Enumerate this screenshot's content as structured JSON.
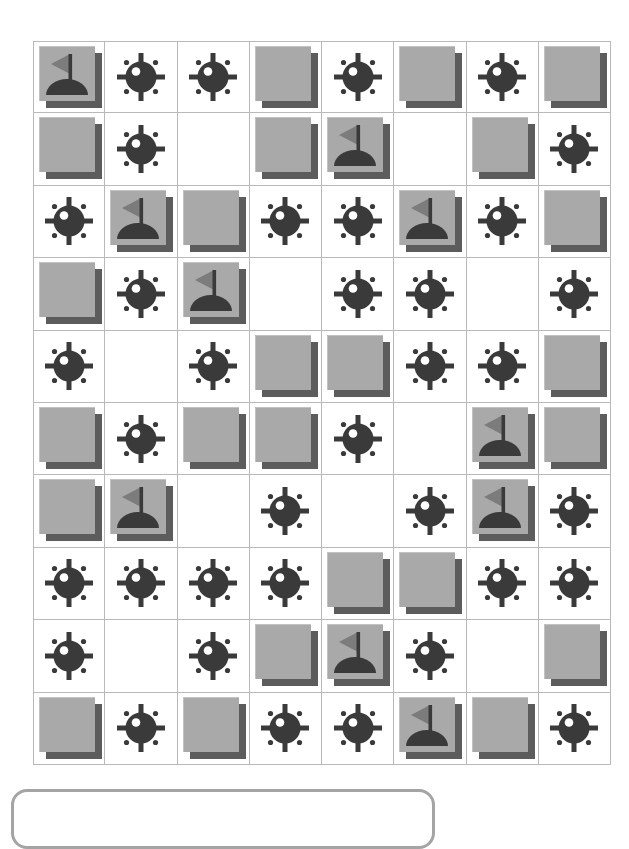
{
  "app": {
    "title": "Minesweeper",
    "board_label": "Minesweeper board",
    "status_panel_label": ""
  },
  "colors": {
    "covered_tile": "#a9a9a9",
    "tile_shadow": "#5c5c5c",
    "tile_highlight": "#c2c2c2",
    "revealed_cell": "#ffffff",
    "mine_dark": "#3a3a3a",
    "flag_dark": "#3a3a3a",
    "grid_line": "#b9b9b9",
    "panel_border": "#a4a4a4",
    "background": "#ffffff"
  },
  "board": {
    "rows": 10,
    "columns": 8,
    "cell_width": 72,
    "cell_height": 72,
    "legend": {
      "covered": "covered-tile",
      "empty": "revealed-empty-cell",
      "mine": "mine-icon",
      "flag": "flag-icon"
    },
    "counts": {
      "mines": 43,
      "flags": 9,
      "covered": 24,
      "empty": 14
    },
    "cells": [
      [
        "flag",
        "mine",
        "mine",
        "covered",
        "mine",
        "covered",
        "mine",
        "covered"
      ],
      [
        "covered",
        "mine",
        "empty",
        "covered",
        "flag",
        "empty",
        "covered",
        "mine"
      ],
      [
        "mine",
        "flag",
        "covered",
        "mine",
        "mine",
        "flag",
        "mine",
        "covered"
      ],
      [
        "covered",
        "mine",
        "flag",
        "empty",
        "mine",
        "mine",
        "empty",
        "mine"
      ],
      [
        "mine",
        "empty",
        "mine",
        "covered",
        "covered",
        "mine",
        "mine",
        "covered"
      ],
      [
        "covered",
        "mine",
        "covered",
        "covered",
        "mine",
        "empty",
        "flag",
        "covered"
      ],
      [
        "covered",
        "flag",
        "empty",
        "mine",
        "empty",
        "mine",
        "flag",
        "mine"
      ],
      [
        "mine",
        "mine",
        "mine",
        "mine",
        "covered",
        "covered",
        "mine",
        "mine"
      ],
      [
        "mine",
        "empty",
        "mine",
        "covered",
        "flag",
        "mine",
        "empty",
        "covered"
      ],
      [
        "covered",
        "mine",
        "covered",
        "mine",
        "mine",
        "flag",
        "covered",
        "mine"
      ]
    ]
  }
}
